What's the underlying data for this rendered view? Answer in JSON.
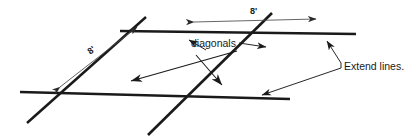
{
  "figure": {
    "labels": {
      "diagonals": "diagonals",
      "extend_lines": "Extend lines.",
      "dimension_top": "8'",
      "dimension_left": "8'"
    },
    "colors": {
      "background": "#ffffff",
      "thick_line": "#1a1a1a",
      "thin_line": "#4a4a4a",
      "leader_line": "#2a2a2a",
      "text": "#1a1a1a"
    },
    "stroke_widths": {
      "thick_line": 2.6,
      "thin_line": 0.8,
      "leader_line": 1.0
    },
    "construction_lines": [
      {
        "name": "top-horizontal-line",
        "x1": 120,
        "y1": 31,
        "x2": 356,
        "y2": 34
      },
      {
        "name": "bottom-horizontal-line",
        "x1": 20,
        "y1": 92,
        "x2": 290,
        "y2": 99
      },
      {
        "name": "left-diagonal-line",
        "x1": 27,
        "y1": 123,
        "x2": 146,
        "y2": 17
      },
      {
        "name": "right-diagonal-line",
        "x1": 148,
        "y1": 135,
        "x2": 272,
        "y2": 13
      }
    ],
    "dimension_lines": [
      {
        "name": "dimension-top-8ft",
        "x1": 190,
        "y1": 22,
        "x2": 320,
        "y2": 19,
        "value": "8'",
        "arrows": "both"
      },
      {
        "name": "dimension-left-8ft",
        "x1": 55,
        "y1": 90,
        "x2": 140,
        "y2": 24,
        "value": "8'",
        "arrows": "both"
      }
    ],
    "leaders": [
      {
        "name": "leader-diagonals-left",
        "from_x": 202,
        "from_y": 51,
        "to_x": 139,
        "to_y": 79
      },
      {
        "name": "leader-diagonals-right",
        "from_x": 250,
        "from_y": 49,
        "to_x": 262,
        "to_y": 45
      },
      {
        "name": "leader-extend-upper",
        "from_x": 342,
        "from_y": 63,
        "to_x": 325,
        "to_y": 38
      },
      {
        "name": "leader-extend-lower",
        "from_x": 342,
        "from_y": 69,
        "to_x": 256,
        "to_y": 96
      }
    ],
    "diagonal_arrows": [
      {
        "name": "diagonal-arrow-down-left",
        "x1": 237,
        "y1": 52,
        "x2": 128,
        "y2": 82
      },
      {
        "name": "diagonal-arrow-down-right",
        "x1": 196,
        "y1": 55,
        "x2": 224,
        "y2": 86
      }
    ]
  }
}
